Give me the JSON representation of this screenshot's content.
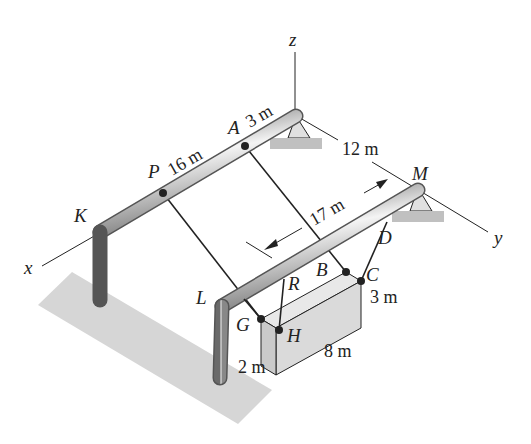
{
  "diagram": {
    "type": "3D statics frame with suspended crate",
    "axes": {
      "x": "x",
      "y": "y",
      "z": "z"
    },
    "points": {
      "A": "A",
      "B": "B",
      "C": "C",
      "D": "D",
      "G": "G",
      "H": "H",
      "K": "K",
      "L": "L",
      "M": "M",
      "P": "P",
      "R": "R"
    },
    "dimensions": {
      "pa": "16 m",
      "a_origin": "3 m",
      "origin_m": "12 m",
      "span": "17 m",
      "crate_height": "3 m",
      "crate_length": "8 m",
      "crate_width": "2 m"
    },
    "colors": {
      "pipe_dark": "#6e6e6e",
      "pipe_light": "#f2f2f2",
      "shadow": "#d4d4d4",
      "crate_top": "#e8e8e8",
      "crate_front": "#d9d9d9",
      "crate_side": "#c8c8c8",
      "line": "#222222"
    }
  }
}
